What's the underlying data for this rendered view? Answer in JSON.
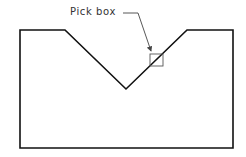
{
  "diagram": {
    "label": "Pick box",
    "colors": {
      "outline": "#111111",
      "pickbox": "#555555",
      "leader": "#444444",
      "background": "#ffffff"
    },
    "outline_points": [
      [
        20,
        30
      ],
      [
        65,
        30
      ],
      [
        126,
        89
      ],
      [
        187,
        30
      ],
      [
        233,
        30
      ],
      [
        233,
        148
      ],
      [
        20,
        148
      ]
    ],
    "pickbox": {
      "x": 150,
      "y": 54,
      "w": 13,
      "h": 12
    }
  }
}
